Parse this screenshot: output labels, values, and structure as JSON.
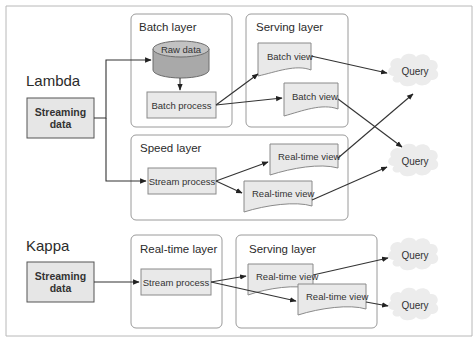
{
  "diagram": {
    "lambda": {
      "title": "Lambda",
      "source": {
        "line1": "Streaming",
        "line2": "data"
      },
      "batch_layer": {
        "title": "Batch layer",
        "raw_data": "Raw data",
        "batch_process": "Batch process"
      },
      "serving_layer": {
        "title": "Serving layer",
        "views": [
          "Batch view",
          "Batch view"
        ]
      },
      "speed_layer": {
        "title": "Speed layer",
        "stream_process": "Stream process",
        "views": [
          "Real-time view",
          "Real-time view"
        ]
      },
      "queries": [
        "Query",
        "Query"
      ]
    },
    "kappa": {
      "title": "Kappa",
      "source": {
        "line1": "Streaming",
        "line2": "data"
      },
      "realtime_layer": {
        "title": "Real-time layer",
        "stream_process": "Stream process"
      },
      "serving_layer": {
        "title": "Serving layer",
        "views": [
          "Real-time view",
          "Real-time view"
        ]
      },
      "queries": [
        "Query",
        "Query"
      ]
    }
  }
}
